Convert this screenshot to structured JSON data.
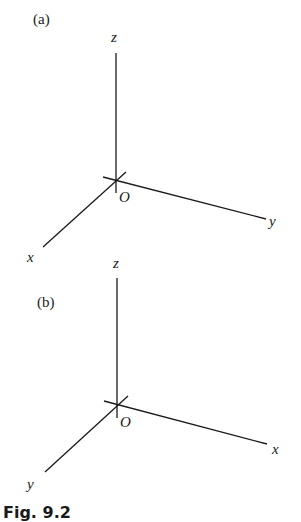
{
  "figure": {
    "caption": "Fig. 9.2",
    "panels": [
      {
        "label": "(a)",
        "origin_label": "O",
        "axes": [
          {
            "name": "z",
            "label": "z",
            "direction": "up"
          },
          {
            "name": "y",
            "label": "y",
            "direction": "right-down"
          },
          {
            "name": "x",
            "label": "x",
            "direction": "left-down"
          }
        ],
        "handedness": "right-handed"
      },
      {
        "label": "(b)",
        "origin_label": "O",
        "axes": [
          {
            "name": "z",
            "label": "z",
            "direction": "up"
          },
          {
            "name": "x",
            "label": "x",
            "direction": "right-down"
          },
          {
            "name": "y",
            "label": "y",
            "direction": "left-down"
          }
        ],
        "handedness": "left-handed"
      }
    ]
  },
  "colors": {
    "ink": "#1a1a1a",
    "background": "#ffffff"
  }
}
